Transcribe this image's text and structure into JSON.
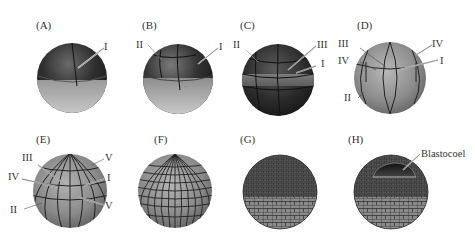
{
  "figure": {
    "panels": [
      {
        "id": "A",
        "label": "(A)",
        "stage": "2-cell",
        "planes": [
          "I"
        ]
      },
      {
        "id": "B",
        "label": "(B)",
        "stage": "4-cell",
        "planes": [
          "II",
          "I"
        ]
      },
      {
        "id": "C",
        "label": "(C)",
        "stage": "8-cell",
        "planes": [
          "II",
          "III",
          "I"
        ]
      },
      {
        "id": "D",
        "label": "(D)",
        "stage": "16-cell",
        "planes": [
          "III",
          "IV",
          "IV",
          "I",
          "II"
        ]
      },
      {
        "id": "E",
        "label": "(E)",
        "stage": "32-cell",
        "planes": [
          "III",
          "V",
          "IV",
          "I",
          "II",
          "V"
        ]
      },
      {
        "id": "F",
        "label": "(F)",
        "stage": "morula",
        "planes": []
      },
      {
        "id": "G",
        "label": "(G)",
        "stage": "blastula",
        "planes": []
      },
      {
        "id": "H",
        "label": "(H)",
        "stage": "blastula cutaway",
        "planes": [],
        "annotation": "Blastocoel"
      }
    ],
    "colors": {
      "animal_dark": "#2e2e2e",
      "vegetal_light": "#bdbdbd",
      "mid_gray": "#7a7a7a",
      "line": "#222222",
      "label_text": "#333333"
    }
  }
}
